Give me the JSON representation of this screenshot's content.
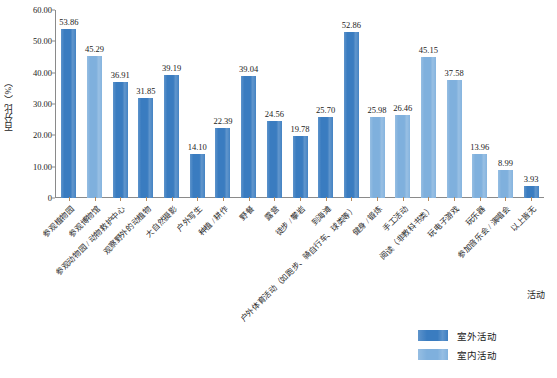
{
  "chart_data": {
    "type": "bar",
    "title": "",
    "xlabel": "活动",
    "ylabel": "百分比（%）",
    "ylim": [
      0,
      60
    ],
    "grid": false,
    "legend_position": "bottom-right",
    "y_ticks": [
      "0",
      "10.00",
      "20.00",
      "30.00",
      "40.00",
      "50.00",
      "60.00"
    ],
    "y_tick_values": [
      0,
      10,
      20,
      30,
      40,
      50,
      60
    ],
    "categories": [
      "参观植物园",
      "参观博物馆",
      "参观动物园 / 动物救护中心",
      "观察野外的动植物",
      "大自然摄影",
      "户外写生",
      "种植 / 耕作",
      "野餐",
      "露营",
      "徒步 / 攀岩",
      "到海滩",
      "户外体育活动（如跑步、骑自行车、球类等）",
      "健身 / 锻炼",
      "手工活动",
      "阅读（非教科书类）",
      "玩电子游戏",
      "玩乐器",
      "参加音乐会 / 演唱会",
      "以上皆无"
    ],
    "values": [
      53.86,
      45.29,
      36.91,
      31.85,
      39.19,
      14.1,
      22.39,
      39.04,
      24.56,
      19.78,
      25.7,
      52.86,
      25.98,
      26.46,
      45.15,
      37.58,
      13.96,
      8.99,
      3.93
    ],
    "bar_labels": [
      "53.86",
      "45.29",
      "36.91",
      "31.85",
      "39.19",
      "14.10",
      "22.39",
      "39.04",
      "24.56",
      "19.78",
      "25.70",
      "52.86",
      "25.98",
      "26.46",
      "45.15",
      "37.58",
      "13.96",
      "8.99",
      "3.93"
    ],
    "series_of_bar": [
      "outdoor",
      "indoor",
      "outdoor",
      "outdoor",
      "outdoor",
      "outdoor",
      "outdoor",
      "outdoor",
      "outdoor",
      "outdoor",
      "outdoor",
      "outdoor",
      "indoor",
      "indoor",
      "indoor",
      "indoor",
      "indoor",
      "indoor",
      "outdoor"
    ],
    "series": [
      {
        "name": "室外活动",
        "color": "#3a7cc0"
      },
      {
        "name": "室内活动",
        "color": "#7fb0dd"
      }
    ]
  },
  "legend": {
    "items": [
      {
        "label": "室外活动",
        "color": "#3a7cc0"
      },
      {
        "label": "室内活动",
        "color": "#7fb0dd"
      }
    ]
  },
  "colors": {
    "outdoor": "#3a7cc0",
    "indoor": "#7fb0dd",
    "axis": "#8a8a8a",
    "tick": "#b5895c",
    "text": "#1a1a1a"
  }
}
